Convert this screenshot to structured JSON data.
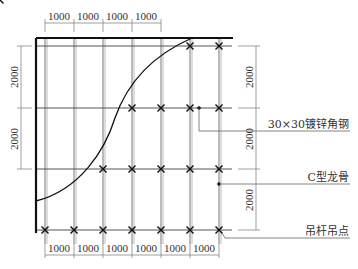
{
  "drawing": {
    "grid": {
      "columns_x": [
        45,
        74,
        103,
        132,
        161,
        190,
        219
      ],
      "rows_y": [
        46,
        108,
        169,
        230
      ]
    },
    "dimensions": {
      "top": [
        "1000",
        "1000",
        "1000",
        "1000"
      ],
      "bottom": [
        "1000",
        "1000",
        "1000",
        "1000",
        "1000",
        "1000"
      ],
      "left": [
        "2000",
        "2000"
      ],
      "right": [
        "2000",
        "2000",
        "2000"
      ]
    },
    "labels": {
      "angle_steel": "30×30镀锌角钢",
      "c_keel": "C型龙骨",
      "hanger_point": "吊杆吊点"
    },
    "colors": {
      "line": "#1a1a1a",
      "grid": "#555555",
      "dim": "#666666"
    }
  }
}
